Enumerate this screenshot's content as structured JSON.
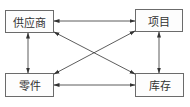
{
  "diagram": {
    "type": "entity-relationship",
    "nodes": [
      {
        "id": "supplier",
        "label": "供应商"
      },
      {
        "id": "project",
        "label": "项目"
      },
      {
        "id": "part",
        "label": "零件"
      },
      {
        "id": "inventory",
        "label": "库存"
      }
    ],
    "edges": [
      {
        "from": "supplier",
        "to": "project",
        "direction": "both"
      },
      {
        "from": "supplier",
        "to": "part",
        "direction": "both"
      },
      {
        "from": "supplier",
        "to": "inventory",
        "direction": "both"
      },
      {
        "from": "project",
        "to": "part",
        "direction": "both"
      },
      {
        "from": "project",
        "to": "inventory",
        "direction": "both"
      },
      {
        "from": "part",
        "to": "inventory",
        "direction": "both"
      }
    ],
    "colors": {
      "line": "#333333",
      "border": "#6b6b6b",
      "text": "#333333"
    }
  }
}
